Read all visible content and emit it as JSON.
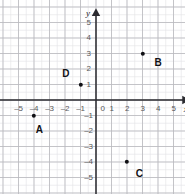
{
  "figure": {
    "kind": "coordinate-plane",
    "x_axis_label": "x",
    "y_axis_label": "y",
    "origin_label": "0"
  },
  "chart_data": {
    "type": "scatter",
    "title": "",
    "xlabel": "x",
    "ylabel": "y",
    "xlim": [
      -6,
      6
    ],
    "ylim": [
      -6,
      6
    ],
    "grid": true,
    "legend": "none",
    "x_ticks": [
      -5,
      -4,
      -3,
      -2,
      -1,
      1,
      2,
      3,
      4,
      5
    ],
    "y_ticks": [
      -5,
      -4,
      -3,
      -2,
      -1,
      1,
      2,
      3,
      4,
      5
    ],
    "x_tick_labels": [
      "–5",
      "–4",
      "–3",
      "–2",
      "–1",
      "1",
      "2",
      "3",
      "4",
      "5"
    ],
    "y_tick_labels": [
      "–5",
      "–4",
      "–3",
      "–2",
      "–1",
      "1",
      "2",
      "3",
      "4",
      "5"
    ],
    "origin_tick_label": "0",
    "points": [
      {
        "label": "A",
        "x": -4,
        "y": -1,
        "label_dx": 0.35,
        "label_dy": -0.95
      },
      {
        "label": "B",
        "x": 3,
        "y": 3,
        "label_dx": 1.0,
        "label_dy": -0.6
      },
      {
        "label": "C",
        "x": 2,
        "y": -4,
        "label_dx": 0.8,
        "label_dy": -0.75
      },
      {
        "label": "D",
        "x": -1,
        "y": 1,
        "label_dx": -0.95,
        "label_dy": 0.65
      }
    ]
  },
  "colors": {
    "background": "#ffffff",
    "major_grid": "#b9b9be",
    "minor_grid": "#e2e2e6",
    "axis": "#2b2b30",
    "point": "#101014",
    "tick_text": "#59595b",
    "axis_text": "#222226"
  }
}
